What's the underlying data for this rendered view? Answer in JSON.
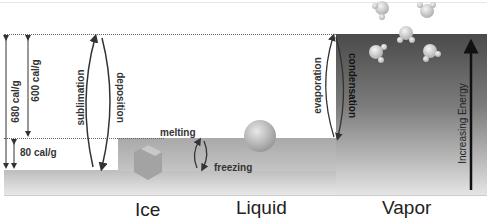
{
  "diagram": {
    "phases": [
      {
        "label": "Ice"
      },
      {
        "label": "Liquid"
      },
      {
        "label": "Vapor"
      }
    ],
    "energy_labels": {
      "sublimation_total": "680 cal/g",
      "vaporization": "600 cal/g",
      "fusion": "80 cal/g"
    },
    "transitions": {
      "sublimation": "sublimation",
      "deposition": "deposition",
      "melting": "melting",
      "freezing": "freezing",
      "evaporation": "evaporation",
      "condensation": "condensation"
    },
    "axis_label": "Increasing Energy",
    "colors": {
      "ice_block": "#bdbdbd",
      "liquid_block": "#a9a9a9",
      "vapor_block_top": "#4a4a4a",
      "arrow": "#333333"
    }
  }
}
